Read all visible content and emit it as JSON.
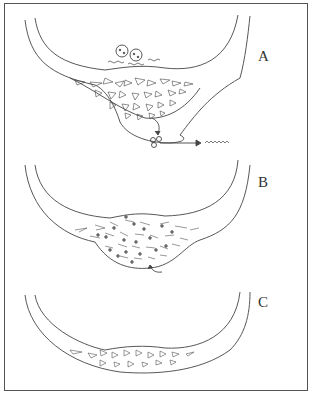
{
  "figure": {
    "panels": [
      {
        "label": "A",
        "description": "Curved wall with thickened trabecular region; cells on top surface; particles released downward with arrow to wavy line"
      },
      {
        "label": "B",
        "description": "Curved wall with thickened region containing dotted cells scattered in mesh; arrow at bottom"
      },
      {
        "label": "C",
        "description": "Curved wall with thinner reduced mesh region"
      }
    ],
    "colors": {
      "line": "#444444",
      "border": "#555555",
      "background": "#ffffff"
    }
  }
}
